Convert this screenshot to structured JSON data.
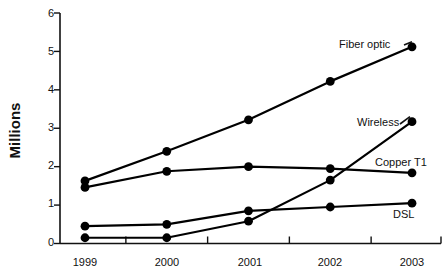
{
  "chart_data": {
    "type": "line",
    "title": "",
    "xlabel": "",
    "ylabel": "Millions",
    "x": [
      "1999",
      "2000",
      "2001",
      "2002",
      "2003"
    ],
    "categories": [
      "1999",
      "2000",
      "2001",
      "2002",
      "2003"
    ],
    "ylim": [
      0,
      6
    ],
    "y_ticks": [
      "0",
      "1",
      "2",
      "3",
      "4",
      "5",
      "6"
    ],
    "grid": false,
    "legend_position": "inline-right",
    "marker": "filled-circle",
    "line_color": "#000000",
    "series": [
      {
        "name": "Fiber optic",
        "values": [
          1.63,
          2.4,
          3.22,
          4.22,
          5.12
        ]
      },
      {
        "name": "Wireless",
        "values": [
          0.15,
          0.15,
          0.58,
          1.65,
          3.17
        ]
      },
      {
        "name": "Copper T1",
        "values": [
          1.46,
          1.88,
          2.0,
          1.95,
          1.84
        ]
      },
      {
        "name": "DSL",
        "values": [
          0.45,
          0.5,
          0.85,
          0.95,
          1.05
        ]
      }
    ]
  },
  "axis": {
    "y_title": "Millions",
    "y_ticks": [
      "6",
      "5",
      "4",
      "3",
      "2",
      "1",
      "0"
    ],
    "x_ticks": [
      "1999",
      "2000",
      "2001",
      "2002",
      "2003"
    ]
  },
  "labels": {
    "fiber_optic": "Fiber optic",
    "wireless": "Wireless",
    "copper_t1": "Copper T1",
    "dsl": "DSL"
  }
}
